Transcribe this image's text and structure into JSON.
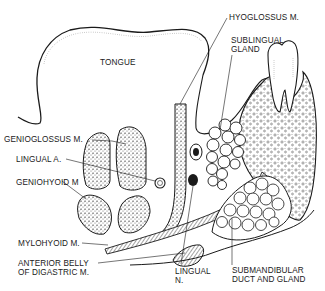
{
  "diagram": {
    "type": "anatomical-cross-section",
    "line_color": "#1a1a1a",
    "background": "#ffffff",
    "labels": {
      "tongue": "TONGUE",
      "hyoglossus": "HYOGLOSSUS M.",
      "sublingual": "SUBLINGUAL\nGLAND",
      "genioglossus": "GENIOGLOSSUS M.",
      "lingual_artery": "LINGUAL A.",
      "geniohyoid": "GENIOHYOID M",
      "mylohyoid": "MYLOHYOID M.",
      "digastric": "ANTERIOR BELLY\nOF DIGASTRIC M.",
      "lingual_nerve": "LINGUAL\nN.",
      "submandibular": "SUBMANDIBULAR\nDUCT AND GLAND"
    },
    "structures": [
      "tongue",
      "hyoglossus-muscle",
      "sublingual-gland",
      "genioglossus-muscle",
      "lingual-artery",
      "geniohyoid-muscle",
      "mylohyoid-muscle",
      "anterior-belly-digastric",
      "lingual-nerve",
      "submandibular-duct-and-gland",
      "tooth",
      "mandible"
    ]
  }
}
